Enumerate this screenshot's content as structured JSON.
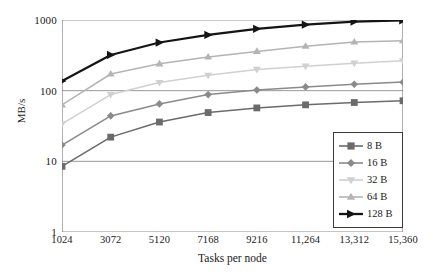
{
  "chart_data": {
    "type": "line",
    "title": "",
    "xlabel": "Tasks per node",
    "ylabel": "MB/s",
    "x": [
      1024,
      3072,
      5120,
      7168,
      9216,
      11264,
      13312,
      15360
    ],
    "xtick_labels": [
      "1024",
      "3072",
      "5120",
      "7168",
      "9216",
      "11,264",
      "13,312",
      "15,360"
    ],
    "ytick_labels": [
      "1000",
      "100",
      "10",
      "1"
    ],
    "ytick_values": [
      1000,
      100,
      10,
      1
    ],
    "yscale": "log",
    "ylim": [
      1,
      1000
    ],
    "xlim": [
      1024,
      15360
    ],
    "grid": "horizontal",
    "legend_position": "lower-right",
    "series": [
      {
        "name": "8 B",
        "marker": "square",
        "color": "#6b6b6b",
        "values": [
          8.5,
          22,
          36,
          49,
          57,
          63,
          68,
          72
        ]
      },
      {
        "name": "16 B",
        "marker": "diamond",
        "color": "#8a8a8a",
        "values": [
          17,
          44,
          65,
          88,
          102,
          113,
          123,
          132
        ]
      },
      {
        "name": "32 B",
        "marker": "triangle-down",
        "color": "#d0d0d0",
        "values": [
          34,
          88,
          130,
          165,
          200,
          222,
          245,
          265
        ]
      },
      {
        "name": "64 B",
        "marker": "triangle-up",
        "color": "#b4b4b4",
        "values": [
          63,
          172,
          240,
          300,
          360,
          425,
          490,
          510
        ]
      },
      {
        "name": "128 B",
        "marker": "triangle-right",
        "color": "#141414",
        "values": [
          137,
          320,
          480,
          615,
          750,
          860,
          950,
          990
        ]
      }
    ]
  },
  "legend": {
    "items": [
      {
        "label": "8 B"
      },
      {
        "label": "16 B"
      },
      {
        "label": "32 B"
      },
      {
        "label": "64 B"
      },
      {
        "label": "128 B"
      }
    ]
  },
  "colors": {
    "axis": "#6e6e6e",
    "grid": "#8c8c8c",
    "legend_border": "#3a3a3a",
    "text": "#1a1a1a"
  }
}
